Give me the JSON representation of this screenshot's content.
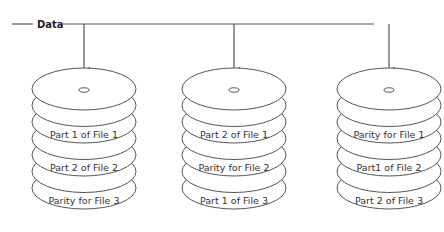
{
  "diagram": {
    "source_label": "Data",
    "stacks": [
      {
        "name": "disk-1",
        "labels": [
          "",
          "Part 1 of File 1",
          "",
          "Part 2 of File 2",
          "",
          "Parity for File 3"
        ]
      },
      {
        "name": "disk-2",
        "labels": [
          "",
          "Part 2 of File 1",
          "",
          "Parity for File 2",
          "",
          "Part 1 of File 3"
        ]
      },
      {
        "name": "disk-3",
        "labels": [
          "",
          "Parity for File 1",
          "",
          "Part1 of File 2",
          "",
          "Part 2 of File 3"
        ]
      }
    ],
    "colors": {
      "line": "#555555",
      "disk_stroke": "#444444",
      "text": "#333333"
    }
  }
}
